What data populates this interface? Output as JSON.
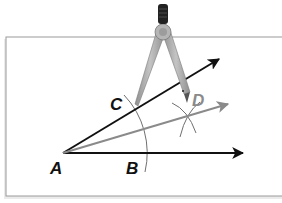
{
  "figure": {
    "type": "angle-bisector-construction",
    "points": {
      "A": {
        "label": "A",
        "x": 63,
        "y": 153
      },
      "B": {
        "label": "B",
        "x": 147,
        "y": 153
      },
      "C": {
        "label": "C",
        "x": 136,
        "y": 108
      },
      "D": {
        "label": "D",
        "x": 187,
        "y": 116
      }
    },
    "rays": [
      {
        "name": "ray-AB",
        "from": "A",
        "to_x": 245,
        "to_y": 153,
        "color": "#111111"
      },
      {
        "name": "ray-AC",
        "from": "A",
        "to_x": 221,
        "to_y": 58,
        "color": "#111111"
      },
      {
        "name": "ray-AD",
        "from": "A",
        "to_x": 230,
        "to_y": 103,
        "color": "#8a8a8a"
      }
    ],
    "arc_color": "#6f6f6f",
    "frame_color": "#9a9a9a",
    "compass_color": "#a6a6a6",
    "compass_handle_color": "#222222"
  },
  "labels": {
    "A": "A",
    "B": "B",
    "C": "C",
    "D": "D"
  },
  "colors": {
    "label_dark": "#111111",
    "label_gray": "#8a8a8a"
  }
}
